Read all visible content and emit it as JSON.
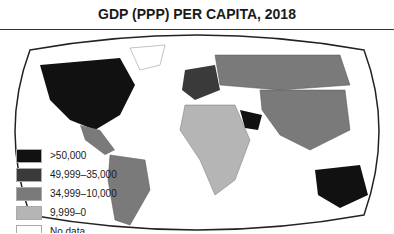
{
  "title": "GDP (PPP) PER CAPITA, 2018",
  "legend": [
    {
      "label": ">50,000",
      "color": "#111111"
    },
    {
      "label": "49,999–35,000",
      "color": "#3a3a3a"
    },
    {
      "label": "34,999–10,000",
      "color": "#7a7a7a"
    },
    {
      "label": "9,999–0",
      "color": "#b5b5b5"
    },
    {
      "label": "No data",
      "color": "#ffffff"
    }
  ],
  "regions": {
    "north_america_us_canada": ">50,000",
    "greenland": "No data",
    "mexico_central_america": "34,999–10,000",
    "south_america": "34,999–10,000",
    "europe_west": "49,999–35,000",
    "russia": "34,999–10,000",
    "africa": "9,999–0",
    "arabian_peninsula": ">50,000",
    "asia": "34,999–10,000",
    "australia": ">50,000"
  }
}
